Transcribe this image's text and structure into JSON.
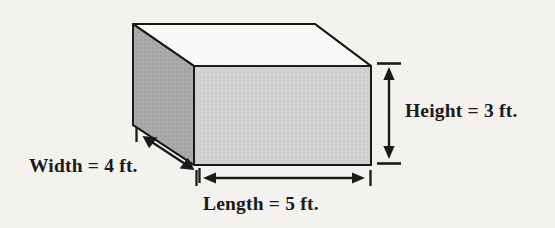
{
  "figure": {
    "shape": "rectangular-box",
    "background_color": "#f4f2ef",
    "stroke_color": "#1a1a1a",
    "faces": {
      "front_fill": "#d2d2d2",
      "side_fill": "#a9a9a9",
      "top_fill": "#fbfaf8"
    },
    "labels": {
      "height": "Height = 3 ft.",
      "width": "Width = 4 ft.",
      "length": "Length = 5 ft."
    },
    "dimensions": [
      {
        "name": "Height",
        "value": 3,
        "unit": "ft.",
        "label": "Height = 3 ft."
      },
      {
        "name": "Width",
        "value": 4,
        "unit": "ft.",
        "label": "Width = 4 ft."
      },
      {
        "name": "Length",
        "value": 5,
        "unit": "ft.",
        "label": "Length = 5 ft."
      }
    ]
  }
}
